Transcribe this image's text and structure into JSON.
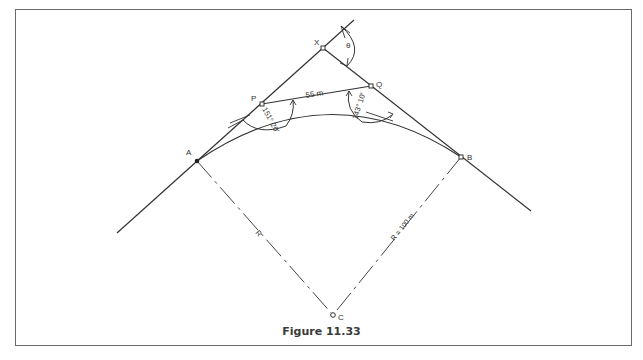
{
  "figure": {
    "caption": "Figure 11.33",
    "points": {
      "A": {
        "label": "A"
      },
      "B": {
        "label": "B"
      },
      "C": {
        "label": "C"
      },
      "P": {
        "label": "P"
      },
      "Q": {
        "label": "Q"
      },
      "X": {
        "label": "X"
      }
    },
    "labels": {
      "theta": "θ",
      "chord_pq": "55 m",
      "angle_p": "151° 20′",
      "angle_q": "143° 10′",
      "radius_left": "R",
      "radius_right": "R = 100 m"
    }
  }
}
